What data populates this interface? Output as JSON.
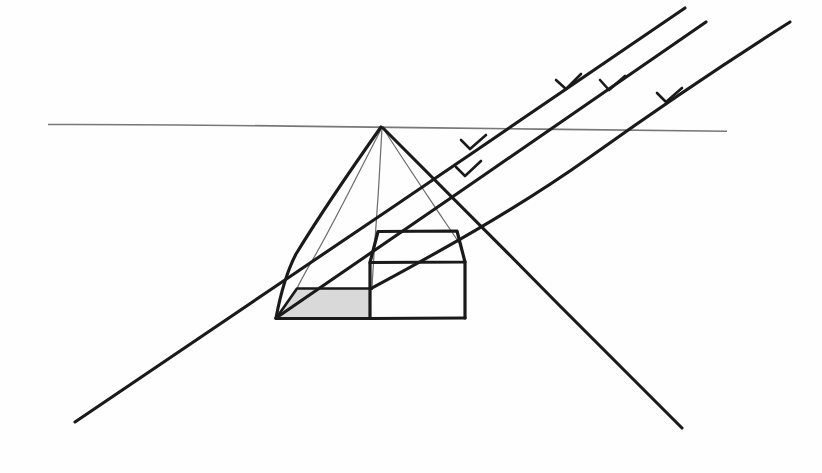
{
  "figure": {
    "background_color": "#fefefe",
    "ink_color": "#1a1a1a",
    "construction_line_color": "#6e6e6e",
    "horizon_color": "#787878",
    "shadow_fill_color": "#d9d9d9",
    "width": 822,
    "height": 473
  },
  "chart_data": {
    "type": "diagram",
    "elements": [
      {
        "name": "horizon-line",
        "kind": "line",
        "points": [
          [
            48,
            124
          ],
          [
            727,
            131
          ]
        ],
        "color": "#787878",
        "weight": "thin"
      },
      {
        "name": "vanishing-point",
        "kind": "point",
        "point": [
          382,
          127
        ],
        "label": "apex / vanishing point on horizon"
      },
      {
        "name": "shadow-cone-left-edge",
        "kind": "line",
        "points": [
          [
            382,
            127
          ],
          [
            276,
            318
          ]
        ],
        "color": "#1a1a1a",
        "weight": "heavy"
      },
      {
        "name": "shadow-cone-right-edge",
        "kind": "line",
        "points": [
          [
            382,
            127
          ],
          [
            682,
            428
          ]
        ],
        "color": "#1a1a1a",
        "weight": "heavy"
      },
      {
        "name": "construction-line-to-shadow-near-corner",
        "kind": "line",
        "points": [
          [
            382,
            127
          ],
          [
            297,
            288
          ]
        ],
        "color": "#6e6e6e",
        "weight": "hairline"
      },
      {
        "name": "construction-line-to-box-top-left",
        "kind": "line",
        "points": [
          [
            382,
            127
          ],
          [
            372,
            290
          ]
        ],
        "color": "#6e6e6e",
        "weight": "hairline"
      },
      {
        "name": "construction-line-to-box-right",
        "kind": "line",
        "points": [
          [
            382,
            127
          ],
          [
            461,
            246
          ]
        ],
        "color": "#6e6e6e",
        "weight": "hairline"
      },
      {
        "name": "box-top-face",
        "kind": "polygon",
        "points": [
          [
            378,
            231
          ],
          [
            457,
            231
          ],
          [
            465,
            262
          ],
          [
            370,
            262
          ]
        ],
        "color": "#1a1a1a",
        "weight": "box"
      },
      {
        "name": "box-front-face",
        "kind": "polygon",
        "points": [
          [
            370,
            262
          ],
          [
            465,
            262
          ],
          [
            465,
            318
          ],
          [
            370,
            318
          ]
        ],
        "color": "#1a1a1a",
        "weight": "box"
      },
      {
        "name": "shadow-ground-polygon",
        "kind": "polygon",
        "points": [
          [
            276,
            318
          ],
          [
            297,
            288
          ],
          [
            372,
            288
          ],
          [
            370,
            318
          ]
        ],
        "fill": "#d9d9d9",
        "color": "#1a1a1a",
        "weight": "med"
      },
      {
        "name": "ground-baseline",
        "kind": "line",
        "points": [
          [
            276,
            318
          ],
          [
            465,
            318
          ]
        ],
        "color": "#1a1a1a",
        "weight": "box"
      },
      {
        "name": "light-ray-1",
        "kind": "ray",
        "points": [
          [
            685,
            8
          ],
          [
            75,
            422
          ]
        ],
        "color": "#1a1a1a",
        "weight": "heavy",
        "direction": "down-left",
        "arrowheads": [
          [
            568,
            87
          ],
          [
            467,
            175
          ]
        ]
      },
      {
        "name": "light-ray-2",
        "kind": "ray",
        "points": [
          [
            706,
            22
          ],
          [
            276,
            318
          ]
        ],
        "color": "#1a1a1a",
        "weight": "heavy",
        "direction": "down-left",
        "arrowheads": [
          [
            611,
            88
          ],
          [
            472,
            148
          ]
        ]
      },
      {
        "name": "light-ray-3",
        "kind": "ray",
        "points": [
          [
            790,
            22
          ],
          [
            372,
            288
          ]
        ],
        "color": "#1a1a1a",
        "weight": "heavy",
        "direction": "down-left",
        "arrowheads": [
          [
            668,
            100
          ]
        ]
      }
    ],
    "notes": {
      "light_direction": "parallel rays travelling down and to the left",
      "shadow": "quadrilateral cast on the ground plane to the left of the box",
      "perspective": "one-point perspective with vanishing point on the horizon"
    }
  }
}
